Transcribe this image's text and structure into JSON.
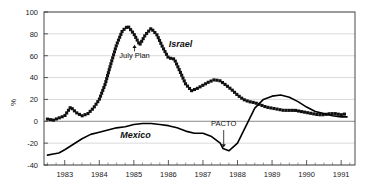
{
  "chart_data": {
    "type": "line",
    "title": "",
    "subtitle": "",
    "xlabel": "",
    "ylabel": "%",
    "xlim": [
      1982.4,
      1991.4
    ],
    "ylim": [
      -40,
      100
    ],
    "ytick_step": 20,
    "yticks": [
      -40,
      -20,
      0,
      20,
      40,
      60,
      80,
      100
    ],
    "ytick_labels": [
      "-40",
      "-20",
      "0",
      "20",
      "40",
      "60",
      "80",
      "100"
    ],
    "xticks": [
      1983,
      1984,
      1985,
      1986,
      1987,
      1988,
      1989,
      1990,
      1991
    ],
    "xtick_labels": [
      "1983",
      "1984",
      "1985",
      "1986",
      "1987",
      "1988",
      "1989",
      "1990",
      "1991"
    ],
    "xtick_minor_per_major": 4,
    "grid": "horizontal",
    "grid_color": "#c9c9c9",
    "zero_line": true,
    "zero_line_color": "#7d7d7d",
    "legend_position": "inline-labels",
    "series": [
      {
        "name": "Israel",
        "style": "dotted",
        "marker": "square-dot",
        "color": "#111111",
        "label_x": 1986.35,
        "label_y": 68,
        "x": [
          1982.5,
          1982.67,
          1982.83,
          1983.0,
          1983.17,
          1983.33,
          1983.5,
          1983.67,
          1983.83,
          1984.0,
          1984.17,
          1984.33,
          1984.5,
          1984.67,
          1984.83,
          1985.0,
          1985.17,
          1985.33,
          1985.5,
          1985.67,
          1985.83,
          1986.0,
          1986.17,
          1986.33,
          1986.5,
          1986.67,
          1986.83,
          1987.0,
          1987.17,
          1987.33,
          1987.5,
          1987.67,
          1987.83,
          1988.0,
          1988.17,
          1988.33,
          1988.5,
          1988.67,
          1988.83,
          1989.0,
          1989.17,
          1989.33,
          1989.5,
          1989.67,
          1989.83,
          1990.0,
          1990.17,
          1990.33,
          1990.5,
          1990.67,
          1990.83,
          1991.0,
          1991.17
        ],
        "y": [
          2,
          1,
          3,
          5,
          13,
          8,
          5,
          7,
          12,
          20,
          34,
          52,
          70,
          83,
          87,
          80,
          70,
          79,
          85,
          79,
          68,
          58,
          57,
          46,
          34,
          28,
          30,
          33,
          36,
          38,
          37,
          33,
          29,
          24,
          20,
          18,
          17,
          15,
          13,
          12,
          11,
          10,
          10,
          10,
          9,
          8,
          7,
          6,
          6,
          7,
          7,
          6,
          7
        ]
      },
      {
        "name": "Mexico",
        "style": "solid",
        "marker": "none",
        "color": "#000000",
        "label_x": 1985.05,
        "label_y": -15,
        "x": [
          1982.5,
          1982.67,
          1982.83,
          1983.0,
          1983.25,
          1983.5,
          1983.75,
          1984.0,
          1984.25,
          1984.5,
          1984.75,
          1985.0,
          1985.25,
          1985.5,
          1985.75,
          1986.0,
          1986.25,
          1986.5,
          1986.75,
          1987.0,
          1987.25,
          1987.5,
          1987.58,
          1987.75,
          1988.0,
          1988.25,
          1988.5,
          1988.75,
          1989.0,
          1989.25,
          1989.5,
          1989.75,
          1990.0,
          1990.25,
          1990.5,
          1990.75,
          1991.0,
          1991.17
        ],
        "y": [
          -31,
          -30,
          -29,
          -26,
          -21,
          -16,
          -12,
          -10,
          -8,
          -6,
          -5,
          -3,
          -2,
          -2,
          -3,
          -4,
          -6,
          -9,
          -11,
          -11,
          -14,
          -20,
          -25,
          -27,
          -20,
          -4,
          12,
          20,
          23,
          24,
          22,
          18,
          13,
          9,
          7,
          5,
          4,
          4
        ]
      }
    ],
    "annotations": [
      {
        "text": "July Plan",
        "text_x": 1985.02,
        "text_y": 58,
        "arrow_from_x": 1985.02,
        "arrow_from_y": 64,
        "arrow_to_x": 1985.02,
        "arrow_to_y": 70
      },
      {
        "text": "PACTO",
        "text_x": 1987.6,
        "text_y": -4,
        "arrow_from_x": 1987.6,
        "arrow_from_y": -8,
        "arrow_to_x": 1987.6,
        "arrow_to_y": -24
      }
    ]
  }
}
